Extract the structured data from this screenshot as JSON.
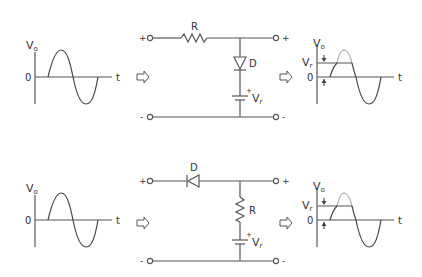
{
  "diagram": {
    "colors": {
      "line": "#555555",
      "wave": "#444444",
      "clipped_wave": "#9a9a9a",
      "background": "#ffffff"
    },
    "panels": [
      {
        "id": "shunt-clipper",
        "input_graph": {
          "y_label": "V",
          "y_sub": "o",
          "zero_label": "0",
          "x_label": "t"
        },
        "circuit": {
          "input_plus": "+",
          "input_minus": "-",
          "output_plus": "+",
          "output_minus": "-",
          "series_element": "R",
          "shunt_element": "D",
          "source_label": "V",
          "source_sub": "r",
          "source_plus": "+"
        },
        "output_graph": {
          "y_label": "V",
          "y_sub": "o",
          "ref_label": "V",
          "ref_sub": "r",
          "zero_label": "0",
          "x_label": "t"
        }
      },
      {
        "id": "series-clipper",
        "input_graph": {
          "y_label": "V",
          "y_sub": "o",
          "zero_label": "0",
          "x_label": "t"
        },
        "circuit": {
          "input_plus": "+",
          "input_minus": "-",
          "output_plus": "+",
          "output_minus": "-",
          "series_element": "D",
          "shunt_element": "R",
          "source_label": "V",
          "source_sub": "r",
          "source_plus": "+"
        },
        "output_graph": {
          "y_label": "V",
          "y_sub": "o",
          "ref_label": "V",
          "ref_sub": "r",
          "zero_label": "0",
          "x_label": "t"
        }
      }
    ],
    "arrows": [
      "input-to-circuit",
      "circuit-to-output"
    ]
  }
}
